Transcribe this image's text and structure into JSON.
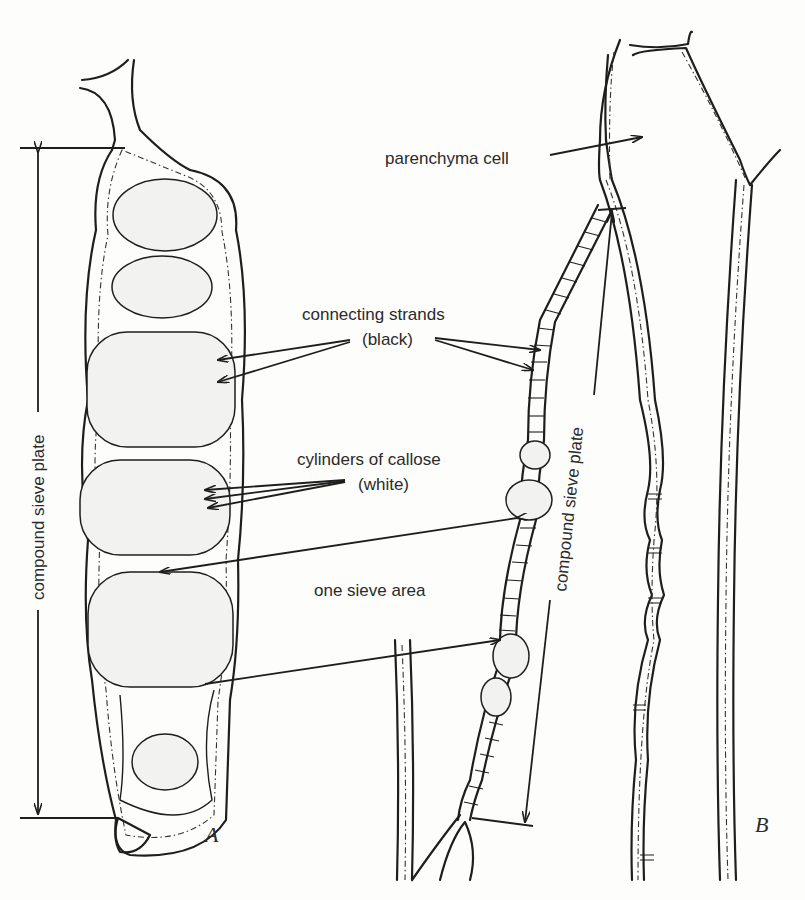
{
  "figure": {
    "panels": [
      {
        "id": "A",
        "label": "A",
        "description": "face view of compound sieve plate with sieve areas"
      },
      {
        "id": "B",
        "label": "B",
        "description": "sectional view of sieve tube walls and compound sieve plate"
      }
    ],
    "labels": {
      "parenchyma_cell": "parenchyma cell",
      "connecting_strands_line1": "connecting strands",
      "connecting_strands_line2": "(black)",
      "cylinders_line1": "cylinders of callose",
      "cylinders_line2": "(white)",
      "one_sieve_area": "one sieve area",
      "compound_sieve_plate_A": "compound sieve plate",
      "compound_sieve_plate_B": "compound sieve plate"
    },
    "sieve_areas_count": 6,
    "colors": {
      "ink": "#1e1e1e",
      "paper": "#fdfdfc",
      "stipple": "#555555"
    }
  }
}
